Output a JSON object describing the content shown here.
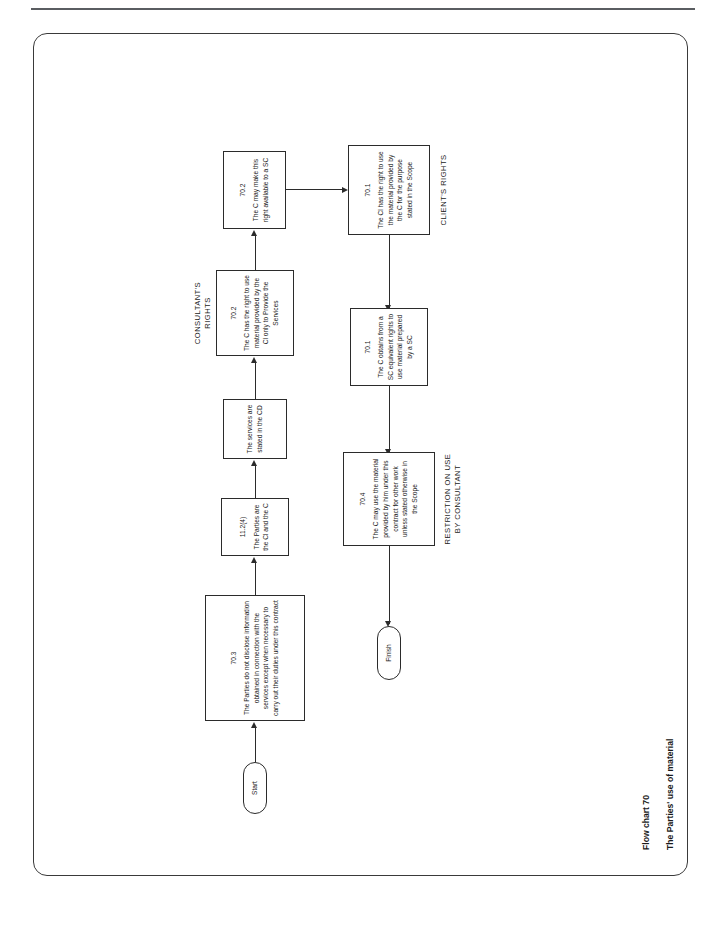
{
  "document": {
    "figure_caption_line1": "Flow chart 70",
    "figure_caption_line2": "The Parties' use of material"
  },
  "diagram": {
    "type": "flowchart",
    "orientation": "landscape-rotated",
    "nodes": [
      {
        "id": "start",
        "shape": "terminator",
        "clause": "",
        "text": "Start"
      },
      {
        "id": "n70_3",
        "shape": "process",
        "clause": "70.3",
        "text": "The Parties do not disclose information obtained in connection with the services except when necessary to carry out their duties under this contract"
      },
      {
        "id": "n11_2_4",
        "shape": "process",
        "clause": "11.2(4)",
        "text": "The Parties are the Cl and the C"
      },
      {
        "id": "n_services_cd",
        "shape": "process",
        "clause": "",
        "text": "The services are stated in the CD"
      },
      {
        "id": "n70_2_consultant",
        "shape": "process",
        "clause": "70.2",
        "text": "The C has the right to use material provided by the Cl only to Provide the Services"
      },
      {
        "id": "n70_2_sc",
        "shape": "process",
        "clause": "70.2",
        "text": "The C may make this right available to a SC"
      },
      {
        "id": "n70_1_client",
        "shape": "process",
        "clause": "70.1",
        "text": "The Cl has the right to use the material provided by the C for the purpose stated in the Scope"
      },
      {
        "id": "n70_1_sc",
        "shape": "process",
        "clause": "70.1",
        "text": "The C obtains from a SC equivalent rights to use material prepared by a SC"
      },
      {
        "id": "n70_4",
        "shape": "process",
        "clause": "70.4",
        "text": "The C may use the material provided by him under this contract for other work unless stated otherwise in the Scope"
      },
      {
        "id": "finish",
        "shape": "terminator",
        "clause": "",
        "text": "Finish"
      }
    ],
    "section_labels": [
      {
        "id": "consultants-rights",
        "text": "CONSULTANT'S RIGHTS"
      },
      {
        "id": "clients-rights",
        "text": "CLIENT'S RIGHTS"
      },
      {
        "id": "restriction-on-use",
        "text": "RESTRICTION ON USE\nBY CONSULTANT"
      }
    ],
    "edges": [
      {
        "from": "start",
        "to": "n70_3"
      },
      {
        "from": "n70_3",
        "to": "n11_2_4"
      },
      {
        "from": "n11_2_4",
        "to": "n_services_cd"
      },
      {
        "from": "n_services_cd",
        "to": "n70_2_consultant"
      },
      {
        "from": "n70_2_consultant",
        "to": "n70_2_sc"
      },
      {
        "from": "n70_2_sc",
        "to": "n70_1_client"
      },
      {
        "from": "n70_1_client",
        "to": "n70_1_sc"
      },
      {
        "from": "n70_1_sc",
        "to": "n70_4"
      },
      {
        "from": "n70_4",
        "to": "finish"
      }
    ]
  },
  "colors": {
    "line": "#2b2b2b",
    "rule": "#5a5d61",
    "frame": "#3a3a3a",
    "text": "#1a1a1a",
    "background": "#ffffff"
  }
}
